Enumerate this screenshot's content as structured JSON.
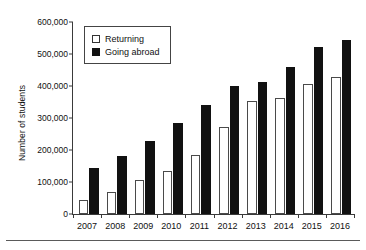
{
  "chart_data": {
    "type": "bar",
    "title": "",
    "xlabel": "",
    "ylabel": "Number of students",
    "categories": [
      "2007",
      "2008",
      "2009",
      "2010",
      "2011",
      "2012",
      "2013",
      "2014",
      "2015",
      "2016"
    ],
    "series": [
      {
        "name": "Returning",
        "color": "#ffffff",
        "values": [
          45000,
          69000,
          105000,
          134000,
          185000,
          272000,
          352000,
          364000,
          406000,
          428000
        ]
      },
      {
        "name": "Going abroad",
        "color": "#111111",
        "values": [
          144000,
          180000,
          229000,
          285000,
          340000,
          400000,
          414000,
          459000,
          523000,
          544000
        ]
      }
    ],
    "ylim": [
      0,
      600000
    ],
    "ytick_values": [
      0,
      100000,
      200000,
      300000,
      400000,
      500000,
      600000
    ],
    "ytick_labels": [
      "0",
      "100,000",
      "200,000",
      "300,000",
      "400,000",
      "500,000",
      "600,000"
    ],
    "grid": false,
    "legend_position": "top-left"
  },
  "legend": {
    "items": [
      {
        "label": "Returning",
        "swatch": "white-square-icon"
      },
      {
        "label": "Going abroad",
        "swatch": "black-square-icon"
      }
    ]
  }
}
